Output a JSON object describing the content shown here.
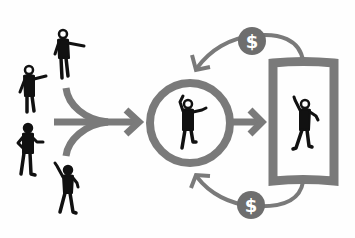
{
  "diagram": {
    "colors": {
      "background": "#fefefe",
      "figure": "#111111",
      "arrow": "#7a7a7a",
      "coin": "#6e6e6e",
      "coin_symbol": "#ffffff"
    },
    "nodes": {
      "crowd": {
        "label": "Crowd of people",
        "count": 4
      },
      "selected_person": {
        "label": "Person in circle"
      },
      "portrait": {
        "label": "Person in frame"
      },
      "payment_top": {
        "symbol": "$"
      },
      "payment_bottom": {
        "symbol": "$"
      }
    },
    "edges": [
      {
        "from": "crowd",
        "to": "selected_person",
        "type": "merge-arrow"
      },
      {
        "from": "selected_person",
        "to": "portrait",
        "type": "arrow"
      },
      {
        "from": "portrait",
        "to": "selected_person",
        "via": "payment_top",
        "type": "curved-arrow"
      },
      {
        "from": "portrait",
        "to": "selected_person",
        "via": "payment_bottom",
        "type": "curved-arrow"
      }
    ]
  }
}
